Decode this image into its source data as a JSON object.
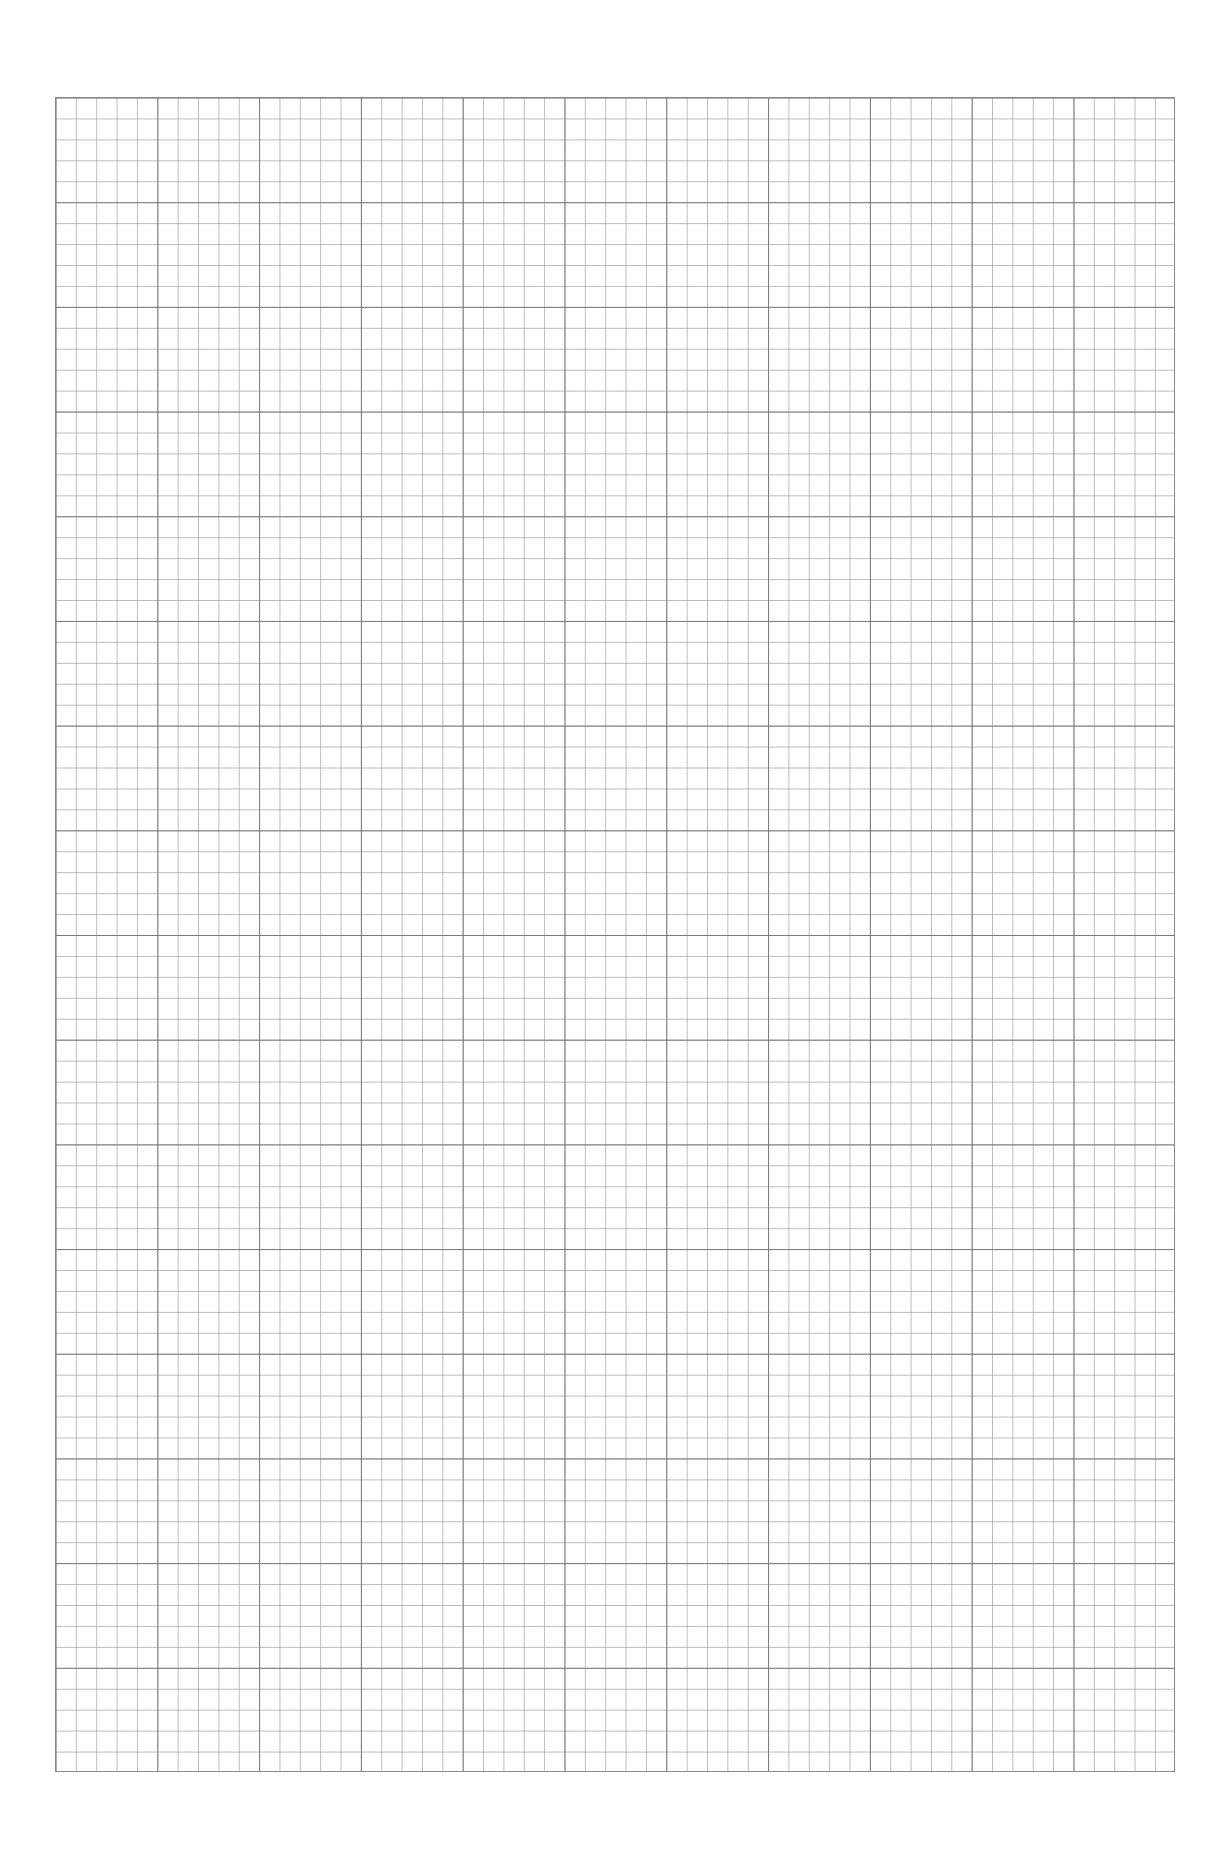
{
  "page": {
    "type": "graph paper",
    "grid": {
      "major_columns": 11,
      "major_rows": 16,
      "minor_per_major": 5,
      "line_color": "#8a8a8a",
      "minor_line_color": "#a0a0a0",
      "background": "#ffffff"
    },
    "caption": ""
  }
}
